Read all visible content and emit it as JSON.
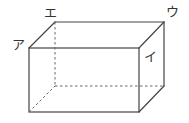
{
  "figure": {
    "type": "rectangular-prism",
    "stroke_color": "#444444",
    "hidden_edge_style": "dashed",
    "labels": {
      "a": "ア",
      "i": "イ",
      "u": "ウ",
      "e": "エ"
    },
    "vertices": {
      "front_top_left": [
        29,
        48
      ],
      "front_top_right": [
        139,
        48
      ],
      "front_bottom_left": [
        29,
        112
      ],
      "front_bottom_right": [
        139,
        112
      ],
      "back_top_left": [
        55,
        22
      ],
      "back_top_right": [
        164,
        22
      ],
      "back_bottom_left": [
        55,
        86
      ],
      "back_bottom_right": [
        164,
        86
      ]
    }
  }
}
